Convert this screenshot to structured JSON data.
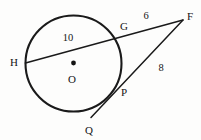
{
  "figure": {
    "kind": "geometry-diagram",
    "background_color": "#fdfdfc",
    "stroke_color": "#1a1a1a",
    "width": 201,
    "height": 140
  },
  "circle": {
    "center_label": "O",
    "center_x": 73.5,
    "center_y": 63.5,
    "radius": 48,
    "has_center_dot": true
  },
  "points": [
    {
      "name": "point-h",
      "label": "H",
      "x": 25.5,
      "y": 63.0,
      "label_x": 14,
      "label_y": 62
    },
    {
      "name": "point-g",
      "label": "G",
      "x": 119.0,
      "y": 33.0,
      "label_x": 124,
      "label_y": 26
    },
    {
      "name": "point-f",
      "label": "F",
      "x": 183.0,
      "y": 20.0,
      "label_x": 190,
      "label_y": 16
    },
    {
      "name": "point-p",
      "label": "P",
      "x": 117.0,
      "y": 87.0,
      "label_x": 124,
      "label_y": 92
    },
    {
      "name": "point-q",
      "label": "Q",
      "x": 91.0,
      "y": 117.5,
      "label_x": 89,
      "label_y": 130
    },
    {
      "name": "point-o",
      "label": "O",
      "x": 73.5,
      "y": 63.5,
      "label_x": 72,
      "label_y": 79
    }
  ],
  "segments": [
    {
      "name": "secant-h-f",
      "from": "H",
      "to": "F",
      "through": "G",
      "measure_label": "6",
      "measure_value": 6,
      "measure_x": 146,
      "measure_y": 16
    },
    {
      "name": "chord-h-g",
      "from": "H",
      "to": "G",
      "measure_label": "10",
      "measure_value": 10,
      "measure_x": 68,
      "measure_y": 38
    },
    {
      "name": "secant-q-f",
      "from": "Q",
      "to": "F",
      "through": "P",
      "measure_label": "8",
      "measure_value": 8,
      "measure_x": 161,
      "measure_y": 68
    }
  ],
  "labels": {
    "h": "H",
    "g": "G",
    "f": "F",
    "p": "P",
    "q": "Q",
    "o": "O",
    "len_gf": "6",
    "len_hg": "10",
    "len_pf": "8"
  }
}
